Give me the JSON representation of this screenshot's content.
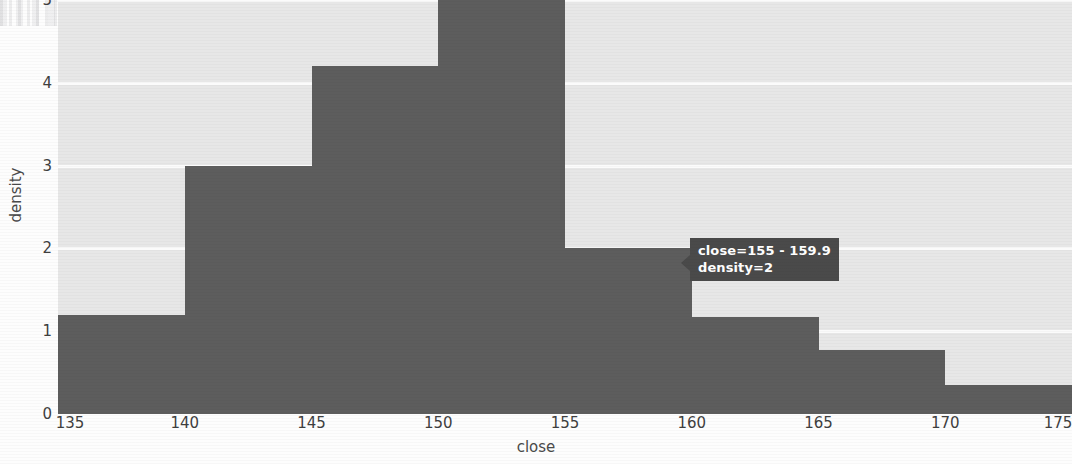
{
  "chart_data": {
    "type": "bar",
    "title": "",
    "xlabel": "close",
    "ylabel": "density",
    "xlim": [
      135,
      175
    ],
    "ylim": [
      0,
      5
    ],
    "grid": true,
    "legend": false,
    "bin_width": 5,
    "bin_labels": [
      "135 - 139.9",
      "140 - 144.9",
      "145 - 149.9",
      "150 - 154.9",
      "155 - 159.9",
      "160 - 164.9",
      "165 - 169.9",
      "170 - 174.9"
    ],
    "bin_starts": [
      135,
      140,
      145,
      150,
      155,
      160,
      165,
      170
    ],
    "bin_ends": [
      140,
      145,
      150,
      155,
      160,
      165,
      170,
      175
    ],
    "values": [
      1.2,
      3,
      4.2,
      5,
      2,
      1.17,
      0.77,
      0.35
    ],
    "xticks": [
      "135",
      "140",
      "145",
      "150",
      "155",
      "160",
      "165",
      "170",
      "175"
    ],
    "xtick_values": [
      135,
      140,
      145,
      150,
      155,
      160,
      165,
      170,
      175
    ],
    "yticks": [
      "0",
      "1",
      "2",
      "3",
      "4",
      "5"
    ],
    "ytick_values": [
      0,
      1,
      2,
      3,
      4,
      5
    ],
    "bar_color": "#5d5d5d",
    "plot_background": "#e7e7e7",
    "gridline_color": "#fbfbfb"
  },
  "tooltip": {
    "line1": "close=155 - 159.9",
    "line2": "density=2",
    "background_color": "#4a4a4a",
    "text_color": "#ffffff",
    "anchor_bin_index": 4
  }
}
